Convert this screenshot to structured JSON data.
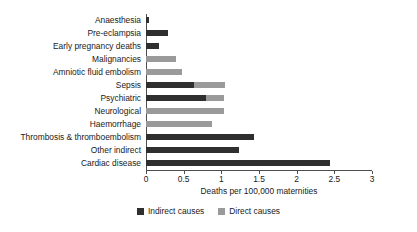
{
  "chart_data": {
    "type": "bar",
    "orientation": "horizontal",
    "title": "",
    "xlabel": "Deaths per 100,000 maternities",
    "ylabel": "",
    "xlim": [
      0,
      3
    ],
    "xticks": [
      0,
      0.5,
      1,
      1.5,
      2,
      2.5,
      3
    ],
    "xtick_labels": [
      "0",
      "0.5",
      "1",
      "1.5",
      "2",
      "2.5",
      "3"
    ],
    "grid": false,
    "legend_position": "bottom",
    "categories": [
      "Anaesthesia",
      "Pre-eclampsia",
      "Early pregnancy deaths",
      "Malignancies",
      "Amniotic fluid embolism",
      "Sepsis",
      "Psychiatric",
      "Neurological",
      "Haemorrhage",
      "Thrombosis & thromboembolism",
      "Other indirect",
      "Cardiac disease"
    ],
    "series": [
      {
        "name": "Indirect causes",
        "color": "#2f2f2f",
        "values": [
          0.04,
          0.29,
          0.17,
          0,
          0,
          0.64,
          0.8,
          0,
          0,
          1.43,
          1.23,
          2.44
        ]
      },
      {
        "name": "Direct causes",
        "color": "#9a9a9a",
        "values": [
          0,
          0,
          0,
          0.4,
          0.48,
          1.05,
          1.03,
          1.03,
          0.87,
          0,
          0,
          0
        ]
      }
    ]
  },
  "legend": {
    "items": [
      {
        "label": "Indirect causes",
        "color": "#2f2f2f"
      },
      {
        "label": "Direct causes",
        "color": "#9a9a9a"
      }
    ]
  }
}
